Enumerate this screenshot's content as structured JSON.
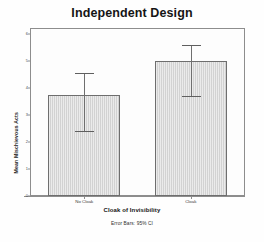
{
  "chart_data": {
    "type": "bar",
    "title": "Independent Design",
    "xlabel": "Cloak of Invisibility",
    "ylabel": "Mean Mischievous Acts",
    "categories": [
      "No Cloak",
      "Cloak"
    ],
    "values": [
      3.75,
      5.0
    ],
    "error_bars": {
      "type": "95% CI",
      "lower": [
        2.4,
        3.7
      ],
      "upper": [
        4.55,
        5.6
      ]
    },
    "ylim": [
      0,
      6
    ],
    "yticks": [
      0,
      1,
      2,
      3,
      4,
      5,
      6
    ],
    "ytick_labels": [
      "0",
      "1",
      "2",
      "3",
      "4",
      "5",
      "6"
    ],
    "grid": false,
    "legend": "none",
    "footnote": "Error Bars: 95% CI",
    "colors": {
      "bar_fill": "#d2d2d2",
      "bar_edge": "#6e6e6e",
      "error_bar": "#6f6f6f",
      "axis": "#8d8d8d",
      "text": "#151515",
      "background": "#fefefe"
    }
  }
}
